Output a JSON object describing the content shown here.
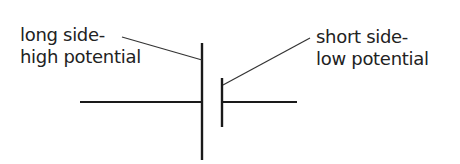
{
  "diagram": {
    "type": "battery-cell-symbol",
    "labels": {
      "long_side": {
        "line1": "long side-",
        "line2": "high potential"
      },
      "short_side": {
        "line1": "short side-",
        "line2": "low potential"
      }
    },
    "colors": {
      "stroke": "#1a1a1a",
      "text": "#222222",
      "background": "#ffffff"
    }
  }
}
